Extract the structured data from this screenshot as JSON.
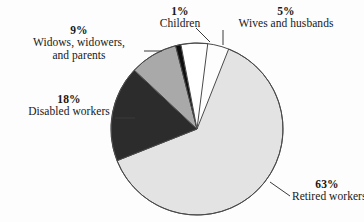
{
  "chart_data": {
    "type": "pie",
    "title": "",
    "subtitle": "",
    "legend_position": "callout-labels",
    "grid": false,
    "categories": [
      "Retired workers",
      "Disabled workers",
      "Widows, widowers, and parents",
      "Wives and husbands",
      "Children"
    ],
    "values": [
      63,
      18,
      9,
      5,
      1
    ],
    "value_unit": "%",
    "slices": [
      {
        "id": "retired",
        "label": "Retired workers",
        "label_lines": [
          "Retired workers"
        ],
        "percent_text": "63%",
        "value": 63,
        "color": "#e3e3e3",
        "start_angle_deg": 21.6,
        "end_angle_deg": 248.4
      },
      {
        "id": "disabled",
        "label": "Disabled workers",
        "label_lines": [
          "Disabled workers"
        ],
        "percent_text": "18%",
        "value": 18,
        "color": "#2c2c2c",
        "start_angle_deg": 248.4,
        "end_angle_deg": 313.2
      },
      {
        "id": "widows",
        "label": "Widows, widowers, and parents",
        "label_lines": [
          "Widows, widowers,",
          "and parents"
        ],
        "percent_text": "9%",
        "value": 9,
        "color": "#a9a9a9",
        "start_angle_deg": 313.2,
        "end_angle_deg": 345.6
      },
      {
        "id": "children",
        "label": "Children",
        "label_lines": [
          "Children"
        ],
        "percent_text": "1%",
        "value": 1,
        "color": "#0f0f0f",
        "start_angle_deg": 345.6,
        "end_angle_deg": 349.2
      },
      {
        "id": "wives",
        "label": "Wives and husbands",
        "label_lines": [
          "Wives and husbands"
        ],
        "percent_text": "5%",
        "value": 5,
        "color": "#ffffff",
        "start_angle_deg": 349.2,
        "end_angle_deg": 367.2
      }
    ],
    "xlabel": "",
    "ylabel": "",
    "total": 96
  },
  "figure": {
    "background_color": "#fdfdfd",
    "outline_color": "#4a4a4a",
    "leader_color": "#3a3a3a",
    "center_x": 197,
    "center_y": 129,
    "radius": 86
  }
}
